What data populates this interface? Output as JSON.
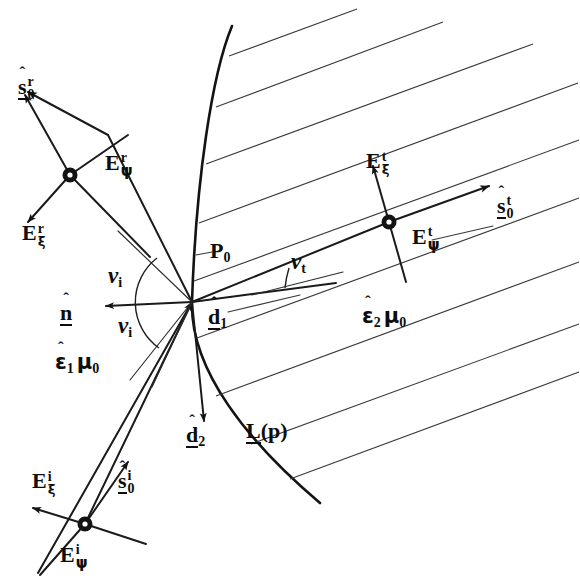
{
  "figure": {
    "background_color": "#ffffff",
    "ink_color": "#131313",
    "width": 580,
    "height": 587
  },
  "regions": {
    "medium_1": {
      "name": "region-1-medium",
      "epsilon": "ε",
      "epsilon_sub": "1",
      "mu": "μ",
      "mu_sub": "0",
      "hat": "ˆ"
    },
    "medium_2": {
      "name": "region-2-medium",
      "epsilon": "ε",
      "epsilon_sub": "2",
      "mu": "μ",
      "mu_sub": "0",
      "hat": "ˆ"
    }
  },
  "labels": {
    "point_p0": {
      "base": "P",
      "sub": "0"
    },
    "surface_L": {
      "base": "L",
      "arg": "(p)"
    },
    "normal": {
      "base": "n",
      "hat": "ˆ"
    },
    "d1": {
      "base": "d",
      "sub": "1",
      "hat": "ˆ"
    },
    "d2": {
      "base": "d",
      "sub": "2",
      "hat": "ˆ"
    },
    "nu_i_upper": {
      "base": "ν",
      "sub": "i"
    },
    "nu_i_lower": {
      "base": "ν",
      "sub": "i"
    },
    "nu_t": {
      "base": "ν",
      "sub": "t"
    },
    "s0_r": {
      "base": "s",
      "sup": "r",
      "sub": "0",
      "hat": "ˆ"
    },
    "s0_i": {
      "base": "s",
      "sup": "i",
      "sub": "0",
      "hat": "ˆ"
    },
    "s0_t": {
      "base": "s",
      "sup": "t",
      "sub": "0",
      "hat": "ˆ"
    },
    "E_psi_r": {
      "base": "E",
      "sup": "r",
      "sub": "ψ"
    },
    "E_xi_r": {
      "base": "E",
      "sup": "r",
      "sub": "ξ"
    },
    "E_psi_i": {
      "base": "E",
      "sup": "i",
      "sub": "ψ"
    },
    "E_xi_i": {
      "base": "E",
      "sup": "i",
      "sub": "ξ"
    },
    "E_psi_t": {
      "base": "E",
      "sup": "t",
      "sub": "ψ"
    },
    "E_xi_t": {
      "base": "E",
      "sup": "t",
      "sub": "ξ"
    }
  },
  "geometry": {
    "junction_point": {
      "x": 192,
      "y": 302
    },
    "reflected_node": {
      "x": 70,
      "y": 175
    },
    "incident_node": {
      "x": 85,
      "y": 524
    },
    "transmitted_node": {
      "x": 389,
      "y": 222
    },
    "interface_curve": "M 232,26 C 206,78 194,186 192,302 C 191,368 245,440 320,503",
    "hatch_line_count": 9,
    "hatch_angle_deg": -20
  }
}
